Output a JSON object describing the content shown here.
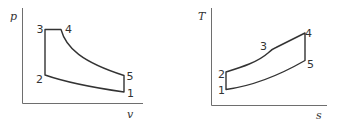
{
  "diagrams": [
    {
      "id": "pv",
      "title": "p-v diagram",
      "y_axis_label": "p",
      "x_axis_label": "v",
      "points": {
        "1": "1",
        "2": "2",
        "3": "3",
        "4": "4",
        "5": "5"
      }
    },
    {
      "id": "ts",
      "title": "T-s diagram",
      "y_axis_label": "T",
      "x_axis_label": "s",
      "points": {
        "1": "1",
        "2": "2",
        "3": "3",
        "4": "4",
        "5": "5"
      }
    }
  ],
  "colors": {
    "axis": "#6e6e6e",
    "curve": "#333333",
    "background": "#ffffff"
  }
}
